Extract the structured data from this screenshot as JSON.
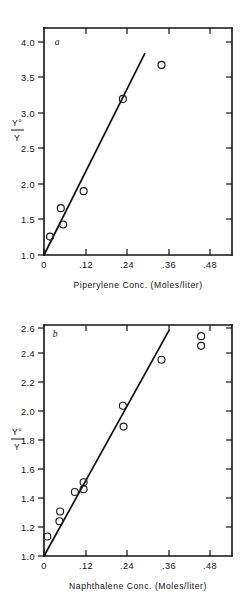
{
  "figure": {
    "name": "two-panel-scatter-figure",
    "background": "#ffffff",
    "ink_color": "#111111"
  },
  "chart_data": [
    {
      "type": "scatter",
      "panel_label": "a",
      "title": "",
      "xlabel": "Piperylene  Conc.  (Moles/liter)",
      "ylabel_numerator": "Y°",
      "ylabel_denominator": "Y",
      "ylabel": "Y°/Y",
      "xlim": [
        0,
        0.56
      ],
      "ylim": [
        1.0,
        4.2
      ],
      "xticks": [
        0,
        0.12,
        0.24,
        0.36,
        0.48
      ],
      "xticklabels": [
        "0",
        ".12",
        ".24",
        ".36",
        ".48"
      ],
      "yticks": [
        1.0,
        1.5,
        2.0,
        2.5,
        3.0,
        3.5,
        4.0
      ],
      "yticklabels": [
        "1.0",
        "1.5",
        "2.0",
        "2.5",
        "3.0",
        "3.5",
        "4.0"
      ],
      "grid": false,
      "legend": "none",
      "marker": "open-circle",
      "points": [
        {
          "x": 0.018,
          "y": 1.26
        },
        {
          "x": 0.05,
          "y": 1.66
        },
        {
          "x": 0.057,
          "y": 1.43
        },
        {
          "x": 0.118,
          "y": 1.9
        },
        {
          "x": 0.235,
          "y": 3.2
        },
        {
          "x": 0.35,
          "y": 3.68
        }
      ],
      "fit_line": {
        "x0": 0.0,
        "y0": 1.0,
        "x1": 0.3,
        "y1": 3.84
      }
    },
    {
      "type": "scatter",
      "panel_label": "b",
      "title": "",
      "xlabel": "Naphthalene  Conc.  (Moles/liter)",
      "ylabel_numerator": "Y°",
      "ylabel_denominator": "Y",
      "ylabel": "Y°/Y",
      "xlim": [
        0,
        0.56
      ],
      "ylim": [
        1.0,
        2.66
      ],
      "xticks": [
        0,
        0.12,
        0.24,
        0.36,
        0.48
      ],
      "xticklabels": [
        "0",
        ".12",
        ".24",
        ".36",
        ".48"
      ],
      "yticks": [
        1.0,
        1.2,
        1.4,
        1.6,
        1.8,
        2.0,
        2.2,
        2.4,
        2.6
      ],
      "yticklabels": [
        "1.0",
        "1.2",
        "1.4",
        "1.6",
        "1.8",
        "2.0",
        "2.2",
        "2.4",
        "2.6"
      ],
      "grid": false,
      "legend": "none",
      "marker": "open-circle",
      "points": [
        {
          "x": 0.01,
          "y": 1.14
        },
        {
          "x": 0.048,
          "y": 1.32
        },
        {
          "x": 0.046,
          "y": 1.25
        },
        {
          "x": 0.092,
          "y": 1.46
        },
        {
          "x": 0.118,
          "y": 1.53
        },
        {
          "x": 0.118,
          "y": 1.48
        },
        {
          "x": 0.235,
          "y": 2.08
        },
        {
          "x": 0.237,
          "y": 1.93
        },
        {
          "x": 0.35,
          "y": 2.41
        },
        {
          "x": 0.468,
          "y": 2.58
        },
        {
          "x": 0.468,
          "y": 2.51
        }
      ],
      "fit_line": {
        "x0": 0.0,
        "y0": 1.0,
        "x1": 0.372,
        "y1": 2.62
      }
    }
  ]
}
